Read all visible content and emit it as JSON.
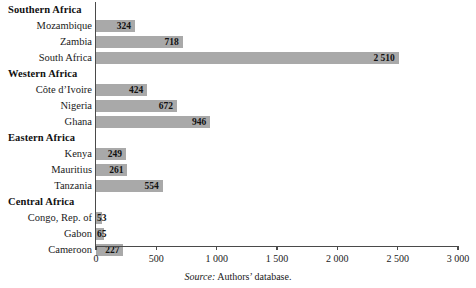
{
  "chart_data": {
    "type": "bar",
    "orientation": "horizontal",
    "title": "",
    "xlabel": "",
    "ylabel": "",
    "xlim": [
      0,
      3000
    ],
    "xticks": [
      0,
      500,
      1000,
      1500,
      2000,
      2500,
      3000
    ],
    "xtick_labels": [
      "0",
      "500",
      "1 000",
      "1 500",
      "2 000",
      "2 500",
      "3 000"
    ],
    "grid": false,
    "legend": false,
    "bar_color": "#a9a9a9",
    "axis_color": "#4a4a4a",
    "groups": [
      {
        "label": "Southern Africa",
        "items": [
          {
            "label": "Mozambique",
            "value": 324,
            "value_label": "324"
          },
          {
            "label": "Zambia",
            "value": 718,
            "value_label": "718"
          },
          {
            "label": "South Africa",
            "value": 2510,
            "value_label": "2 510"
          }
        ]
      },
      {
        "label": "Western Africa",
        "items": [
          {
            "label": "Côte d’Ivoire",
            "value": 424,
            "value_label": "424"
          },
          {
            "label": "Nigeria",
            "value": 672,
            "value_label": "672"
          },
          {
            "label": "Ghana",
            "value": 946,
            "value_label": "946"
          }
        ]
      },
      {
        "label": "Eastern Africa",
        "items": [
          {
            "label": "Kenya",
            "value": 249,
            "value_label": "249"
          },
          {
            "label": "Mauritius",
            "value": 261,
            "value_label": "261"
          },
          {
            "label": "Tanzania",
            "value": 554,
            "value_label": "554"
          }
        ]
      },
      {
        "label": "Central Africa",
        "items": [
          {
            "label": "Congo, Rep. of",
            "value": 53,
            "value_label": "53"
          },
          {
            "label": "Gabon",
            "value": 65,
            "value_label": "65"
          },
          {
            "label": "Cameroon",
            "value": 227,
            "value_label": "227"
          }
        ]
      }
    ],
    "categories": [
      "Mozambique",
      "Zambia",
      "South Africa",
      "Côte d’Ivoire",
      "Nigeria",
      "Ghana",
      "Kenya",
      "Mauritius",
      "Tanzania",
      "Congo, Rep. of",
      "Gabon",
      "Cameroon"
    ],
    "values": [
      324,
      718,
      2510,
      424,
      672,
      946,
      249,
      261,
      554,
      53,
      65,
      227
    ]
  },
  "source": {
    "prefix": "Source:",
    "text": "Authors’ database."
  }
}
